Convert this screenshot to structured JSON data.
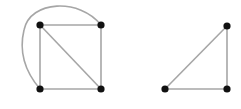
{
  "diagram": {
    "type": "graph",
    "colors": {
      "edge": "#a6a6a6",
      "node": "#111111",
      "background": "#ffffff"
    },
    "graphs": [
      {
        "name": "left-graph",
        "nodes": [
          {
            "id": "a",
            "x": 40,
            "y": 25
          },
          {
            "id": "b",
            "x": 101,
            "y": 25
          },
          {
            "id": "c",
            "x": 40,
            "y": 89
          },
          {
            "id": "d",
            "x": 101,
            "y": 89
          }
        ],
        "edges": [
          {
            "from": "a",
            "to": "b"
          },
          {
            "from": "a",
            "to": "c"
          },
          {
            "from": "b",
            "to": "d"
          },
          {
            "from": "c",
            "to": "d"
          },
          {
            "from": "a",
            "to": "d"
          },
          {
            "from": "b",
            "to": "c",
            "curved": true
          }
        ]
      },
      {
        "name": "right-graph",
        "nodes": [
          {
            "id": "e",
            "x": 227,
            "y": 26
          },
          {
            "id": "f",
            "x": 165,
            "y": 89
          },
          {
            "id": "g",
            "x": 227,
            "y": 89
          }
        ],
        "edges": [
          {
            "from": "e",
            "to": "f"
          },
          {
            "from": "e",
            "to": "g"
          },
          {
            "from": "f",
            "to": "g"
          }
        ]
      }
    ]
  }
}
